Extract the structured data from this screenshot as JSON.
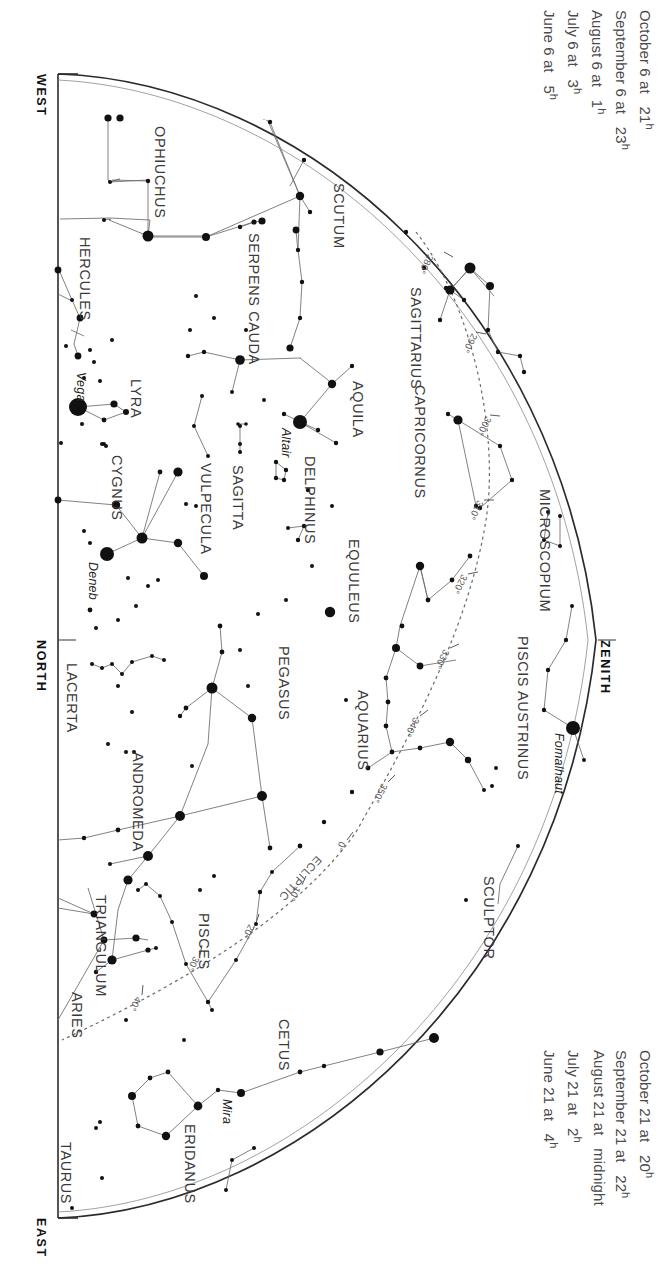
{
  "chart_data": {
    "type": "scatter",
    "projection": "half-dome horizon map, rotated 90 degrees",
    "xlabel": "",
    "ylabel": "",
    "grid": false,
    "legend": "none",
    "directions": [
      {
        "name": "WEST",
        "x": 48,
        "y": 74
      },
      {
        "name": "NORTH",
        "x": 48,
        "y": 640
      },
      {
        "name": "EAST",
        "x": 48,
        "y": 1218
      },
      {
        "name": "ZENITH",
        "x": 612,
        "y": 640
      }
    ],
    "constellations": [
      {
        "label": "OPHIUCHUS",
        "x": 168,
        "y": 126,
        "rot": 90
      },
      {
        "label": "HERCULES",
        "x": 93,
        "y": 237,
        "rot": 90
      },
      {
        "label": "SERPENS CAUDA",
        "x": 262,
        "y": 233,
        "rot": 90
      },
      {
        "label": "SCUTUM",
        "x": 347,
        "y": 183,
        "rot": 90
      },
      {
        "label": "SAGITTARIUS",
        "x": 424,
        "y": 287,
        "rot": 90
      },
      {
        "label": "CAPRICORNUS",
        "x": 428,
        "y": 385,
        "rot": 90
      },
      {
        "label": "AQUILA",
        "x": 366,
        "y": 381,
        "rot": 90
      },
      {
        "label": "LYRA",
        "x": 144,
        "y": 379,
        "rot": 90
      },
      {
        "label": "CYGNUS",
        "x": 125,
        "y": 455,
        "rot": 90
      },
      {
        "label": "VULPECULA",
        "x": 214,
        "y": 463,
        "rot": 90
      },
      {
        "label": "SAGITTA",
        "x": 246,
        "y": 465,
        "rot": 90
      },
      {
        "label": "DELPHINUS",
        "x": 318,
        "y": 456,
        "rot": 90
      },
      {
        "label": "EQUULEUS",
        "x": 362,
        "y": 539,
        "rot": 90
      },
      {
        "label": "MICROSCOPIUM",
        "x": 553,
        "y": 489,
        "rot": 90
      },
      {
        "label": "PISCIS AUSTRINUS",
        "x": 531,
        "y": 636,
        "rot": 90
      },
      {
        "label": "PEGASUS",
        "x": 292,
        "y": 646,
        "rot": 90
      },
      {
        "label": "AQUARIUS",
        "x": 371,
        "y": 690,
        "rot": 90
      },
      {
        "label": "LACERTA",
        "x": 80,
        "y": 663,
        "rot": 90
      },
      {
        "label": "ANDROMEDA",
        "x": 146,
        "y": 752,
        "rot": 90
      },
      {
        "label": "TRIANGULUM",
        "x": 109,
        "y": 895,
        "rot": 90
      },
      {
        "label": "PISCES",
        "x": 212,
        "y": 913,
        "rot": 90
      },
      {
        "label": "ARIES",
        "x": 85,
        "y": 992,
        "rot": 90
      },
      {
        "label": "SCULPTOR",
        "x": 497,
        "y": 876,
        "rot": 90
      },
      {
        "label": "CETUS",
        "x": 292,
        "y": 1019,
        "rot": 90
      },
      {
        "label": "ERIDANUS",
        "x": 198,
        "y": 1124,
        "rot": 90
      },
      {
        "label": "TAURUS",
        "x": 74,
        "y": 1142,
        "rot": 90
      }
    ],
    "named_stars": [
      {
        "name": "Vega",
        "x": 78,
        "y": 407,
        "label_x": 88,
        "label_y": 372,
        "mag": 0.0
      },
      {
        "name": "Deneb",
        "x": 107,
        "y": 554,
        "label_x": 100,
        "label_y": 562,
        "mag": 1.2
      },
      {
        "name": "Altair",
        "x": 300,
        "y": 422,
        "label_x": 293,
        "label_y": 428,
        "mag": 0.8
      },
      {
        "name": "Fomalhaut",
        "x": 573,
        "y": 728,
        "label_x": 566,
        "label_y": 733,
        "mag": 1.2
      },
      {
        "name": "Mira",
        "x": 241,
        "y": 1093,
        "label_x": 234,
        "label_y": 1099,
        "mag": 3.0
      }
    ],
    "ecliptic_label": "ECLIPTIC",
    "ecliptic_ticks": [
      {
        "deg": "280°",
        "x": 436,
        "y": 258
      },
      {
        "deg": "290°",
        "x": 480,
        "y": 337
      },
      {
        "deg": "300°",
        "x": 494,
        "y": 420
      },
      {
        "deg": "310°",
        "x": 486,
        "y": 504
      },
      {
        "deg": "320°",
        "x": 470,
        "y": 578
      },
      {
        "deg": "330°",
        "x": 452,
        "y": 653
      },
      {
        "deg": "340°",
        "x": 422,
        "y": 721
      },
      {
        "deg": "350°",
        "x": 390,
        "y": 787
      },
      {
        "deg": "0°",
        "x": 348,
        "y": 845
      },
      {
        "deg": "10°",
        "x": 303,
        "y": 890
      },
      {
        "deg": "20°",
        "x": 257,
        "y": 928
      },
      {
        "deg": "30°",
        "x": 202,
        "y": 960
      },
      {
        "deg": "40°",
        "x": 144,
        "y": 1000
      }
    ]
  },
  "caption_top": {
    "lines": [
      {
        "date": "June 6 at",
        "time": "5",
        "unit": "h"
      },
      {
        "date": "July 6 at",
        "time": "3",
        "unit": "h"
      },
      {
        "date": "August 6 at",
        "time": "1",
        "unit": "h"
      },
      {
        "date": "September 6 at",
        "time": "23",
        "unit": "h"
      },
      {
        "date": "October 6 at",
        "time": "21",
        "unit": "h"
      }
    ]
  },
  "caption_bottom": {
    "lines": [
      {
        "date": "June 21 at",
        "time": "4",
        "unit": "h"
      },
      {
        "date": "July 21 at",
        "time": "2",
        "unit": "h"
      },
      {
        "date": "August 21 at",
        "time": "midnight",
        "unit": ""
      },
      {
        "date": "September 21 at",
        "time": "22",
        "unit": "h"
      },
      {
        "date": "October 21 at",
        "time": "20",
        "unit": "h"
      }
    ]
  },
  "colors": {
    "ink": "#1b1b1b",
    "label": "#3a3a3a",
    "horizon": "#2b2b2b",
    "constellation_line": "#5d5d5d",
    "ecliptic": "#6a6a6a",
    "caption": "#4a4a4a"
  }
}
